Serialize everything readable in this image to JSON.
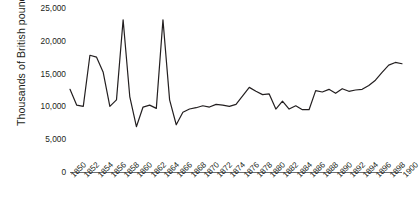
{
  "chart_data": {
    "type": "line",
    "title": "",
    "xlabel": "",
    "ylabel": "Thousands of British pounds",
    "xlim": [
      1850,
      1900
    ],
    "ylim": [
      0,
      25000
    ],
    "grid": false,
    "legend": "none",
    "ytick_labels": [
      "25,000",
      "20,000",
      "15,000",
      "10,000",
      "5,000",
      "0"
    ],
    "ytick_values": [
      25000,
      20000,
      15000,
      10000,
      5000,
      0
    ],
    "xtick_labels": [
      "1850",
      "1852",
      "1854",
      "1856",
      "1858",
      "1860",
      "1862",
      "1864",
      "1866",
      "1868",
      "1870",
      "1872",
      "1874",
      "1876",
      "1878",
      "1880",
      "1882",
      "1884",
      "1886",
      "1888",
      "1890",
      "1892",
      "1894",
      "1896",
      "1898",
      "1900"
    ],
    "xtick_values": [
      1850,
      1852,
      1854,
      1856,
      1858,
      1860,
      1862,
      1864,
      1866,
      1868,
      1870,
      1872,
      1874,
      1876,
      1878,
      1880,
      1882,
      1884,
      1886,
      1888,
      1890,
      1892,
      1894,
      1896,
      1898,
      1900
    ],
    "line_color": "#231f20",
    "line_width": 1.2,
    "x": [
      1850,
      1851,
      1852,
      1853,
      1854,
      1855,
      1856,
      1857,
      1858,
      1859,
      1860,
      1861,
      1862,
      1863,
      1864,
      1865,
      1866,
      1867,
      1868,
      1869,
      1870,
      1871,
      1872,
      1873,
      1874,
      1875,
      1876,
      1877,
      1878,
      1879,
      1880,
      1881,
      1882,
      1883,
      1884,
      1885,
      1886,
      1887,
      1888,
      1889,
      1890,
      1891,
      1892,
      1893,
      1894,
      1895,
      1896,
      1897,
      1898,
      1899,
      1900
    ],
    "values": [
      12600,
      10200,
      10000,
      17800,
      17500,
      15200,
      10000,
      11000,
      23200,
      11500,
      6900,
      9900,
      10200,
      9700,
      23200,
      11000,
      7200,
      9100,
      9600,
      9800,
      10100,
      9900,
      10300,
      10200,
      10000,
      10300,
      11600,
      12900,
      12300,
      11800,
      11900,
      9600,
      10800,
      9600,
      10100,
      9500,
      9500,
      12400,
      12200,
      12600,
      12000,
      12700,
      12300,
      12500,
      12600,
      13200,
      14000,
      15200,
      16300,
      16700,
      16500
    ],
    "series": [
      {
        "name": "Value",
        "values": [
          12600,
          10200,
          10000,
          17800,
          17500,
          15200,
          10000,
          11000,
          23200,
          11500,
          6900,
          9900,
          10200,
          9700,
          23200,
          11000,
          7200,
          9100,
          9600,
          9800,
          10100,
          9900,
          10300,
          10200,
          10000,
          10300,
          11600,
          12900,
          12300,
          11800,
          11900,
          9600,
          10800,
          9600,
          10100,
          9500,
          9500,
          12400,
          12200,
          12600,
          12000,
          12700,
          12300,
          12500,
          12600,
          13200,
          14000,
          15200,
          16300,
          16700,
          16500
        ]
      }
    ]
  }
}
